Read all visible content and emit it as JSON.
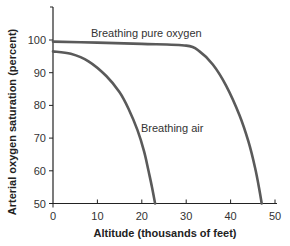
{
  "chart_data": {
    "type": "line",
    "title": "",
    "xlabel": "Altitude (thousands of feet)",
    "ylabel": "Arterial oxygen saturation (percent)",
    "xlim": [
      0,
      50
    ],
    "ylim": [
      50,
      110
    ],
    "x_ticks": [
      0,
      10,
      20,
      30,
      40,
      50
    ],
    "y_ticks": [
      50,
      60,
      70,
      80,
      90,
      100
    ],
    "grid": false,
    "legend": "none (inline curve labels)",
    "series": [
      {
        "name": "Breathing pure oxygen",
        "x": [
          0,
          10,
          20,
          30,
          33,
          36,
          39,
          42,
          44,
          45.5,
          46.5,
          47
        ],
        "y": [
          99.5,
          99.2,
          98.8,
          98.3,
          96.5,
          92.5,
          86,
          77,
          69,
          61,
          54,
          50
        ]
      },
      {
        "name": "Breathing air",
        "x": [
          0,
          4,
          8,
          12,
          15,
          17,
          19,
          20.5,
          21.5,
          22.3,
          23
        ],
        "y": [
          96.5,
          95.8,
          93.5,
          89,
          84,
          79,
          72.5,
          66,
          60,
          55,
          50
        ]
      }
    ],
    "annotations": [
      {
        "text": "Breathing pure oxygen",
        "x": 13,
        "y": 101.5
      },
      {
        "text": "Breathing air",
        "x": 21.5,
        "y": 76
      }
    ]
  },
  "labels": {
    "xlabel": "Altitude (thousands of feet)",
    "ylabel": "Arterial oxygen saturation (percent)",
    "oxygen": "Breathing pure oxygen",
    "air": "Breathing air",
    "x_ticks": [
      "0",
      "10",
      "20",
      "30",
      "40",
      "50"
    ],
    "y_ticks": [
      "50",
      "60",
      "70",
      "80",
      "90",
      "100"
    ]
  },
  "colors": {
    "curve": "#5a5a5a",
    "axis": "#222222"
  }
}
